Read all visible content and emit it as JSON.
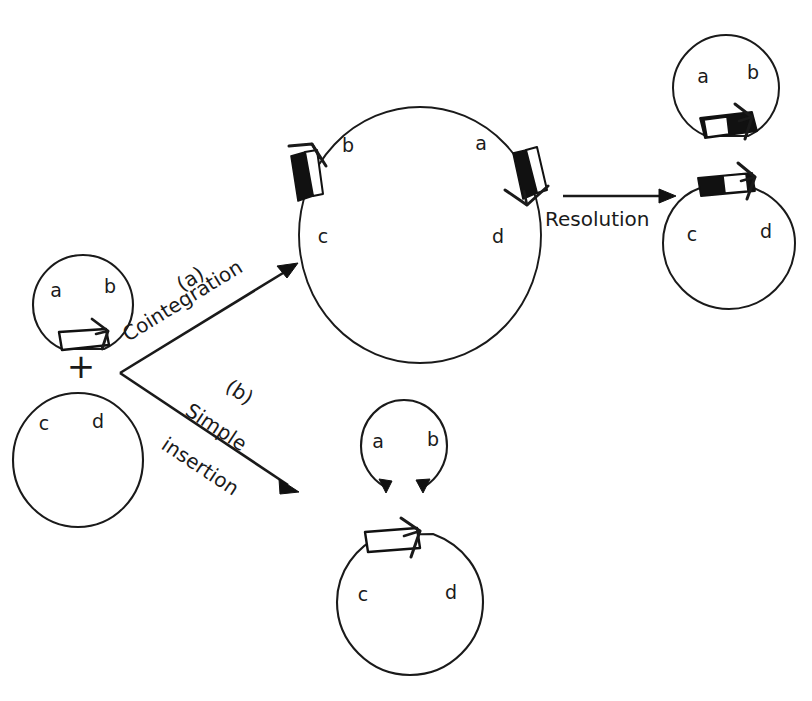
{
  "figure": {
    "background_color": "#ffffff",
    "ink_color": "#1a1a1a",
    "width": 812,
    "height": 701
  },
  "labels": {
    "plus": "+",
    "branch_a_tag": "(a)",
    "branch_a_name": "Cointegration",
    "branch_b_tag": "(b)",
    "branch_b_name_line1": "Simple",
    "branch_b_name_line2": "insertion",
    "resolution": "Resolution"
  },
  "plasmids": [
    {
      "id": "donor-ab",
      "role": "donor plasmid carrying transposon",
      "genes": [
        "a",
        "b"
      ],
      "element": "open-arrow-box",
      "element_position": "bottom",
      "center": [
        83,
        305
      ],
      "radius": 50
    },
    {
      "id": "recipient-cd",
      "role": "recipient target plasmid",
      "genes": [
        "c",
        "d"
      ],
      "element": "none",
      "element_position": "none",
      "center": [
        78,
        460
      ],
      "radius": 66
    },
    {
      "id": "cointegrate",
      "role": "cointegrate molecule with two copies of element",
      "genes": [
        "b",
        "a",
        "c",
        "d"
      ],
      "element": "two-filled-arrow-boxes",
      "element_position": "left-and-right",
      "center": [
        420,
        235
      ],
      "radius": 125
    },
    {
      "id": "resolved-ab",
      "role": "resolved donor plasmid",
      "genes": [
        "a",
        "b"
      ],
      "element": "filled-arrow-box",
      "element_position": "bottom",
      "center": [
        726,
        88
      ],
      "radius": 53
    },
    {
      "id": "resolved-cd",
      "role": "resolved target plasmid with element",
      "genes": [
        "c",
        "d"
      ],
      "element": "filled-arrow-box",
      "element_position": "top",
      "center": [
        729,
        243
      ],
      "radius": 66
    },
    {
      "id": "insertion-ab-open",
      "role": "donor left as broken / open circle",
      "genes": [
        "a",
        "b"
      ],
      "element": "open-circle-gap",
      "element_position": "bottom-gap",
      "center": [
        404,
        446
      ],
      "radius": 46
    },
    {
      "id": "insertion-cd",
      "role": "target plasmid with simple insertion",
      "genes": [
        "c",
        "d"
      ],
      "element": "open-arrow-box",
      "element_position": "top",
      "center": [
        410,
        602
      ],
      "radius": 73
    }
  ],
  "arrows": [
    {
      "id": "arrow-cointegration",
      "from": [
        120,
        373
      ],
      "to": [
        296,
        264
      ],
      "label": "(a) Cointegration"
    },
    {
      "id": "arrow-simple-insertion",
      "from": [
        120,
        373
      ],
      "to": [
        298,
        492
      ],
      "label": "(b) Simple insertion"
    },
    {
      "id": "arrow-resolution",
      "from": [
        563,
        196
      ],
      "to": [
        673,
        196
      ],
      "label": "Resolution"
    }
  ],
  "gene_label_positions": {
    "donor_ab": [
      [
        56,
        297
      ],
      [
        110,
        293
      ]
    ],
    "recipient_cd": [
      [
        44,
        430
      ],
      [
        98,
        428
      ]
    ],
    "cointegrate": [
      [
        348,
        147
      ],
      [
        480,
        145
      ],
      [
        322,
        238
      ],
      [
        497,
        238
      ]
    ],
    "resolved_ab": [
      [
        702,
        76
      ],
      [
        752,
        72
      ]
    ],
    "resolved_cd": [
      [
        692,
        236
      ],
      [
        765,
        233
      ]
    ],
    "insertion_ab": [
      [
        378,
        441
      ],
      [
        432,
        440
      ]
    ],
    "insertion_cd": [
      [
        363,
        596
      ],
      [
        450,
        594
      ]
    ]
  }
}
